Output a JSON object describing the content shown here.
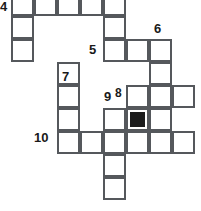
{
  "puzzle": {
    "kind": "crossword-grid",
    "title": "",
    "width": 201,
    "height": 211,
    "cell_size": 23,
    "grid_origin": {
      "x": 11,
      "y": -7
    },
    "colors": {
      "cell_fill": "#ffffff",
      "cell_border": "#55585c",
      "blocked_fill": "#1c1c1c",
      "number_color": "#1a1a1a",
      "background": "#ffffff"
    },
    "cells": [
      {
        "name": "cell-r0-c0",
        "col": 0,
        "row": 0,
        "blocked": false
      },
      {
        "name": "cell-r0-c1",
        "col": 1,
        "row": 0,
        "blocked": false
      },
      {
        "name": "cell-r0-c2",
        "col": 2,
        "row": 0,
        "blocked": false
      },
      {
        "name": "cell-r0-c3",
        "col": 3,
        "row": 0,
        "blocked": false
      },
      {
        "name": "cell-r0-c4",
        "col": 4,
        "row": 0,
        "blocked": false
      },
      {
        "name": "cell-r1-c0",
        "col": 0,
        "row": 1,
        "blocked": false
      },
      {
        "name": "cell-r1-c4",
        "col": 4,
        "row": 1,
        "blocked": false
      },
      {
        "name": "cell-r2-c0",
        "col": 0,
        "row": 2,
        "blocked": false
      },
      {
        "name": "cell-r2-c4",
        "col": 4,
        "row": 2,
        "blocked": false
      },
      {
        "name": "cell-r2-c5",
        "col": 5,
        "row": 2,
        "blocked": false
      },
      {
        "name": "cell-r2-c6",
        "col": 6,
        "row": 2,
        "blocked": false
      },
      {
        "name": "cell-r3-c2",
        "col": 2,
        "row": 3,
        "blocked": false
      },
      {
        "name": "cell-r3-c6",
        "col": 6,
        "row": 3,
        "blocked": false
      },
      {
        "name": "cell-r4-c2",
        "col": 2,
        "row": 4,
        "blocked": false
      },
      {
        "name": "cell-r4-c5",
        "col": 5,
        "row": 4,
        "blocked": false
      },
      {
        "name": "cell-r4-c6",
        "col": 6,
        "row": 4,
        "blocked": false
      },
      {
        "name": "cell-r4-c7",
        "col": 7,
        "row": 4,
        "blocked": false
      },
      {
        "name": "cell-r5-c2",
        "col": 2,
        "row": 5,
        "blocked": false
      },
      {
        "name": "cell-r5-c4",
        "col": 4,
        "row": 5,
        "blocked": false
      },
      {
        "name": "cell-r5-c5",
        "col": 5,
        "row": 5,
        "blocked": true
      },
      {
        "name": "cell-r5-c6",
        "col": 6,
        "row": 5,
        "blocked": false
      },
      {
        "name": "cell-r6-c2",
        "col": 2,
        "row": 6,
        "blocked": false
      },
      {
        "name": "cell-r6-c3",
        "col": 3,
        "row": 6,
        "blocked": false
      },
      {
        "name": "cell-r6-c4",
        "col": 4,
        "row": 6,
        "blocked": false
      },
      {
        "name": "cell-r6-c5",
        "col": 5,
        "row": 6,
        "blocked": false
      },
      {
        "name": "cell-r6-c6",
        "col": 6,
        "row": 6,
        "blocked": false
      },
      {
        "name": "cell-r6-c7",
        "col": 7,
        "row": 6,
        "blocked": false
      },
      {
        "name": "cell-r7-c4",
        "col": 4,
        "row": 7,
        "blocked": false
      },
      {
        "name": "cell-r8-c4",
        "col": 4,
        "row": 8,
        "blocked": false
      }
    ],
    "clue_numbers": [
      {
        "name": "clue-number-4",
        "label": "4",
        "x": 0,
        "y": 0,
        "size": "normal"
      },
      {
        "name": "clue-number-5",
        "label": "5",
        "x": 89,
        "y": 43,
        "size": "normal"
      },
      {
        "name": "clue-number-6",
        "label": "6",
        "x": 154,
        "y": 22,
        "size": "normal"
      },
      {
        "name": "clue-number-7",
        "label": "7",
        "x": 62,
        "y": 70,
        "size": "normal"
      },
      {
        "name": "clue-number-8",
        "label": "8",
        "x": 115,
        "y": 87,
        "size": "small"
      },
      {
        "name": "clue-number-9",
        "label": "9",
        "x": 104,
        "y": 90,
        "size": "normal"
      },
      {
        "name": "clue-number-10",
        "label": "10",
        "x": 34,
        "y": 131,
        "size": "normal"
      }
    ]
  }
}
